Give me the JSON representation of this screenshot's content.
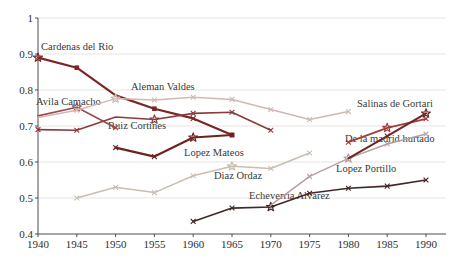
{
  "page": {
    "background": "#ffffff"
  },
  "chart_data": {
    "type": "line",
    "title": "",
    "xlabel": "",
    "ylabel": "",
    "xlim": [
      1940,
      1990
    ],
    "ylim": [
      0.4,
      1.0
    ],
    "grid": "horizontal",
    "legend": "inline-annotations",
    "axis_color": "#4d4d4d",
    "grid_color": "#e8e5e1",
    "text_color": "#2e2e2e",
    "x_ticks": [
      1940,
      1945,
      1950,
      1955,
      1960,
      1965,
      1970,
      1975,
      1980,
      1985,
      1990
    ],
    "y_ticks": [
      [
        "1",
        1.0
      ],
      [
        "0.9",
        0.9
      ],
      [
        "0.8",
        0.8
      ],
      [
        "0.7",
        0.7
      ],
      [
        "0.6",
        0.6
      ],
      [
        "0.5",
        0.5
      ],
      [
        "0.4",
        0.4
      ]
    ],
    "series": [
      {
        "name": "Cardenas del Rio",
        "color": "#7b2626",
        "width": 2.2,
        "label_px": [
          41,
          41
        ],
        "points": [
          [
            1940,
            0.89,
            "star"
          ],
          [
            1945,
            0.862,
            "sq"
          ],
          [
            1950,
            0.785,
            ""
          ],
          [
            1955,
            0.748,
            "sq"
          ],
          [
            1960,
            0.721,
            "x"
          ],
          [
            1965,
            0.675,
            "sq"
          ]
        ]
      },
      {
        "name": "Avila Camacho",
        "color": "#9c4a4a",
        "width": 1.6,
        "label_px": [
          36,
          96
        ],
        "points": [
          [
            1940,
            0.728,
            ""
          ],
          [
            1945,
            0.752,
            "star"
          ],
          [
            1950,
            0.695,
            "x"
          ]
        ]
      },
      {
        "name": "Aleman Valdes",
        "color": "#cfb9b5",
        "width": 1.5,
        "label_px": [
          131,
          81
        ],
        "points": [
          [
            1940,
            0.724,
            ""
          ],
          [
            1945,
            0.744,
            "x"
          ],
          [
            1950,
            0.776,
            "star"
          ],
          [
            1955,
            0.772,
            "x"
          ],
          [
            1960,
            0.78,
            "x"
          ],
          [
            1965,
            0.774,
            "x"
          ],
          [
            1970,
            0.746,
            "x"
          ],
          [
            1975,
            0.718,
            "x"
          ],
          [
            1980,
            0.74,
            "x"
          ]
        ]
      },
      {
        "name": "Ruiz Cortines",
        "color": "#8a3d3d",
        "width": 1.6,
        "label_px": [
          108,
          120
        ],
        "points": [
          [
            1940,
            0.69,
            "x"
          ],
          [
            1945,
            0.688,
            "x"
          ],
          [
            1950,
            0.725,
            ""
          ],
          [
            1955,
            0.718,
            "star"
          ],
          [
            1960,
            0.735,
            "x"
          ],
          [
            1965,
            0.738,
            "x"
          ],
          [
            1970,
            0.688,
            "x"
          ]
        ]
      },
      {
        "name": "Lopez Mateos",
        "color": "#6e2222",
        "width": 2.2,
        "label_px": [
          184,
          147
        ],
        "points": [
          [
            1950,
            0.64,
            "x"
          ],
          [
            1955,
            0.615,
            "x"
          ],
          [
            1960,
            0.668,
            "star"
          ],
          [
            1965,
            0.675,
            "sq"
          ]
        ]
      },
      {
        "name": "Diaz Ordaz",
        "color": "#c8beb2",
        "width": 1.5,
        "label_px": [
          214,
          170
        ],
        "points": [
          [
            1945,
            0.5,
            "x"
          ],
          [
            1950,
            0.53,
            "x"
          ],
          [
            1955,
            0.515,
            "x"
          ],
          [
            1960,
            0.562,
            "x"
          ],
          [
            1965,
            0.588,
            "star"
          ],
          [
            1970,
            0.582,
            "x"
          ],
          [
            1975,
            0.625,
            "x"
          ]
        ]
      },
      {
        "name": "Echeverria Alvarez",
        "color": "#432626",
        "width": 1.6,
        "label_px": [
          249,
          190
        ],
        "points": [
          [
            1960,
            0.435,
            "x"
          ],
          [
            1965,
            0.472,
            "x"
          ],
          [
            1970,
            0.475,
            "star"
          ],
          [
            1975,
            0.513,
            "x"
          ],
          [
            1980,
            0.527,
            "x"
          ],
          [
            1985,
            0.533,
            "x"
          ],
          [
            1990,
            0.55,
            "x"
          ]
        ]
      },
      {
        "name": "Lopez Portillo",
        "color": "#b5a0a0",
        "width": 1.5,
        "label_px": [
          336,
          163
        ],
        "points": [
          [
            1970,
            0.48,
            ""
          ],
          [
            1975,
            0.56,
            "x"
          ],
          [
            1980,
            0.61,
            "star"
          ],
          [
            1985,
            0.65,
            "x"
          ],
          [
            1990,
            0.678,
            "x"
          ]
        ]
      },
      {
        "name": "De la madrid hurtado",
        "color": "#a33c3c",
        "width": 1.8,
        "label_px": [
          345,
          133
        ],
        "points": [
          [
            1980,
            0.655,
            "x"
          ],
          [
            1985,
            0.695,
            "star"
          ],
          [
            1990,
            0.72,
            "x"
          ]
        ]
      },
      {
        "name": "Salinas de Gortari",
        "color": "#6f2525",
        "width": 2.0,
        "label_px": [
          357,
          98
        ],
        "points": [
          [
            1980,
            0.61,
            ""
          ],
          [
            1985,
            0.672,
            "x"
          ],
          [
            1990,
            0.735,
            "star"
          ]
        ]
      }
    ]
  }
}
